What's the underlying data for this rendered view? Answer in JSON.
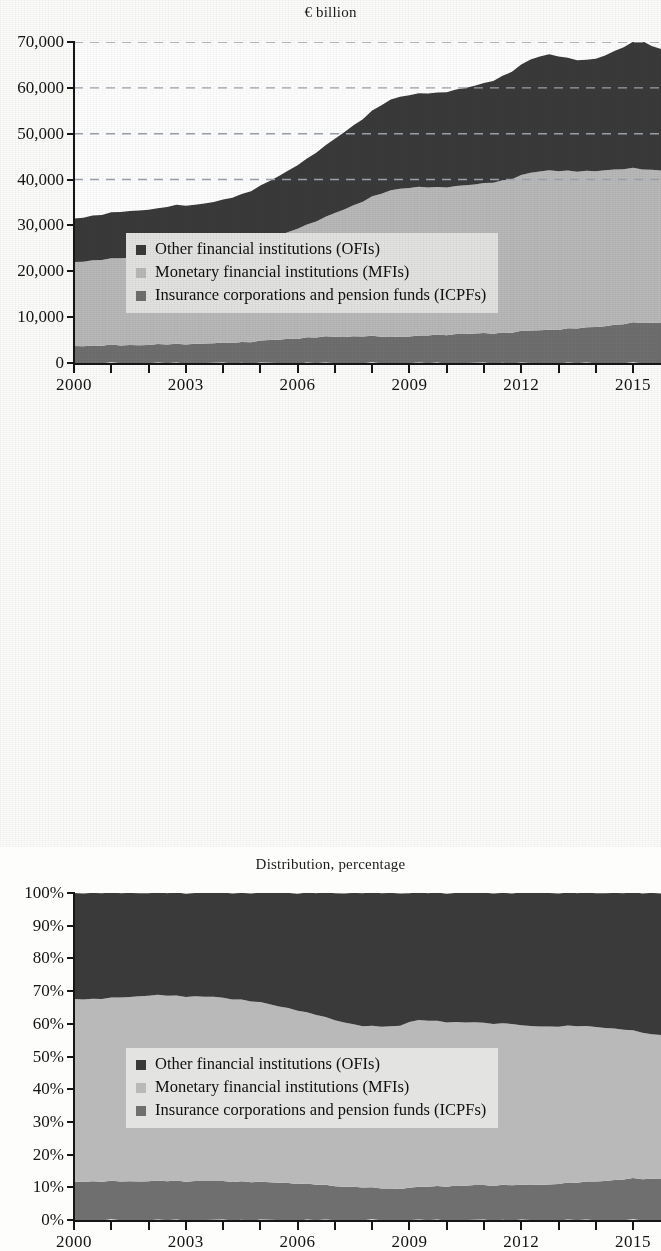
{
  "figure": {
    "panels": [
      {
        "id": "top",
        "title": "€ billion",
        "y_ticks": [
          "70,000",
          "60,000",
          "50,000",
          "40,000",
          "30,000",
          "20,000",
          "10,000",
          "0"
        ],
        "x_labels": [
          "2000",
          "2003",
          "2006",
          "2009",
          "2012",
          "2015"
        ]
      },
      {
        "id": "bottom",
        "title": "Distribution, percentage",
        "y_ticks": [
          "100%",
          "90%",
          "80%",
          "70%",
          "60%",
          "50%",
          "40%",
          "30%",
          "20%",
          "10%",
          "0%"
        ],
        "x_labels": [
          "2000",
          "2003",
          "2006",
          "2009",
          "2012",
          "2015"
        ]
      }
    ]
  },
  "legend": {
    "items": [
      {
        "label": "Other financial institutions (OFIs)",
        "swatch": "legend-swatch-ofi",
        "color": "#3a3a3a"
      },
      {
        "label": "Monetary financial institutions (MFIs)",
        "swatch": "legend-swatch-mfi",
        "color": "#b9b9b9"
      },
      {
        "label": "Insurance corporations and pension funds (ICPFs)",
        "swatch": "legend-swatch-icpf",
        "color": "#6f6f6f"
      }
    ]
  },
  "colors": {
    "ofi": "#3a3a3a",
    "mfi": "#b9b9b9",
    "icpf": "#6f6f6f",
    "axis": "#161616",
    "gridline": "#9aa3ad",
    "legend_background": "#e3e3e1",
    "plot_background": "#ffffff",
    "page_background": "#fdfdfb"
  },
  "chart_data": [
    {
      "type": "area",
      "id": "euro-billion-stacked-area",
      "title": "€ billion",
      "xlabel": "",
      "ylabel": "€ billion",
      "stacked": true,
      "grid": "horizontal-dashed (40,000 / 50,000 / 60,000 / 70,000)",
      "legend_position": "inside-lower-left",
      "xlim": [
        2000,
        2015.75
      ],
      "ylim": [
        0,
        70000
      ],
      "ytick_values": [
        0,
        10000,
        20000,
        30000,
        40000,
        50000,
        60000,
        70000
      ],
      "xtick_values": [
        2000,
        2001,
        2002,
        2003,
        2004,
        2005,
        2006,
        2007,
        2008,
        2009,
        2010,
        2011,
        2012,
        2013,
        2014,
        2015
      ],
      "xtick_labels_shown": [
        "2000",
        "2003",
        "2006",
        "2009",
        "2012",
        "2015"
      ],
      "x": [
        2000,
        2000.25,
        2000.5,
        2000.75,
        2001,
        2001.25,
        2001.5,
        2001.75,
        2002,
        2002.25,
        2002.5,
        2002.75,
        2003,
        2003.25,
        2003.5,
        2003.75,
        2004,
        2004.25,
        2004.5,
        2004.75,
        2005,
        2005.25,
        2005.5,
        2005.75,
        2006,
        2006.25,
        2006.5,
        2006.75,
        2007,
        2007.25,
        2007.5,
        2007.75,
        2008,
        2008.25,
        2008.5,
        2008.75,
        2009,
        2009.25,
        2009.5,
        2009.75,
        2010,
        2010.25,
        2010.5,
        2010.75,
        2011,
        2011.25,
        2011.5,
        2011.75,
        2012,
        2012.25,
        2012.5,
        2012.75,
        2013,
        2013.25,
        2013.5,
        2013.75,
        2014,
        2014.25,
        2014.5,
        2014.75,
        2015,
        2015.25,
        2015.5,
        2015.75
      ],
      "series": [
        {
          "name": "Insurance corporations and pension funds (ICPFs)",
          "short": "ICPFs",
          "color": "#6f6f6f",
          "values": [
            3700,
            3750,
            3800,
            3820,
            3850,
            3880,
            3900,
            3950,
            3980,
            4000,
            4050,
            4100,
            4150,
            4200,
            4250,
            4300,
            4350,
            4450,
            4550,
            4650,
            4800,
            4950,
            5100,
            5250,
            5400,
            5500,
            5600,
            5700,
            5750,
            5780,
            5800,
            5820,
            5800,
            5780,
            5750,
            5760,
            5800,
            5900,
            6000,
            6100,
            6200,
            6300,
            6350,
            6400,
            6450,
            6500,
            6600,
            6700,
            6900,
            7050,
            7150,
            7250,
            7350,
            7450,
            7550,
            7700,
            7900,
            8100,
            8300,
            8500,
            8700,
            8800,
            8750,
            8800
          ]
        },
        {
          "name": "Monetary financial institutions (MFIs)",
          "short": "MFIs",
          "color": "#b9b9b9",
          "values": [
            18300,
            18450,
            18600,
            18700,
            18850,
            19000,
            19050,
            19100,
            19150,
            19200,
            19300,
            19400,
            19500,
            19600,
            19750,
            19900,
            20100,
            20400,
            20750,
            21100,
            21600,
            22100,
            22700,
            23300,
            24000,
            24600,
            25300,
            26100,
            27000,
            27800,
            28600,
            29400,
            30400,
            31200,
            31900,
            32300,
            32400,
            32400,
            32300,
            32200,
            32200,
            32300,
            32400,
            32500,
            32700,
            32900,
            33200,
            33500,
            34000,
            34400,
            34600,
            34800,
            34600,
            34400,
            34200,
            34100,
            34000,
            34000,
            33900,
            33800,
            33700,
            33500,
            33350,
            33300
          ]
        },
        {
          "name": "Other financial institutions (OFIs)",
          "short": "OFIs",
          "color": "#3a3a3a",
          "values": [
            9500,
            9600,
            9750,
            9850,
            10000,
            10100,
            10200,
            10250,
            10350,
            10450,
            10700,
            10900,
            10800,
            10700,
            10800,
            10900,
            11100,
            11300,
            11500,
            11800,
            12200,
            12600,
            13000,
            13400,
            13900,
            14400,
            15000,
            15600,
            16200,
            16800,
            17400,
            18000,
            18700,
            19300,
            19800,
            20100,
            20200,
            20400,
            20500,
            20600,
            20800,
            21000,
            21200,
            21500,
            21800,
            22200,
            22800,
            23400,
            24100,
            24700,
            25100,
            25300,
            25000,
            24600,
            24300,
            24200,
            24500,
            25000,
            25800,
            26600,
            27500,
            28000,
            27000,
            26500
          ]
        }
      ]
    },
    {
      "type": "area",
      "id": "distribution-percentage-stacked-area",
      "title": "Distribution, percentage",
      "xlabel": "",
      "ylabel": "Distribution, percentage",
      "stacked": true,
      "normalized": true,
      "grid": "none",
      "legend_position": "inside-middle-left",
      "xlim": [
        2000,
        2015.75
      ],
      "ylim": [
        0,
        100
      ],
      "ytick_values": [
        0,
        10,
        20,
        30,
        40,
        50,
        60,
        70,
        80,
        90,
        100
      ],
      "xtick_values": [
        2000,
        2001,
        2002,
        2003,
        2004,
        2005,
        2006,
        2007,
        2008,
        2009,
        2010,
        2011,
        2012,
        2013,
        2014,
        2015
      ],
      "xtick_labels_shown": [
        "2000",
        "2003",
        "2006",
        "2009",
        "2012",
        "2015"
      ],
      "x": [
        2000,
        2000.25,
        2000.5,
        2000.75,
        2001,
        2001.25,
        2001.5,
        2001.75,
        2002,
        2002.25,
        2002.5,
        2002.75,
        2003,
        2003.25,
        2003.5,
        2003.75,
        2004,
        2004.25,
        2004.5,
        2004.75,
        2005,
        2005.25,
        2005.5,
        2005.75,
        2006,
        2006.25,
        2006.5,
        2006.75,
        2007,
        2007.25,
        2007.5,
        2007.75,
        2008,
        2008.25,
        2008.5,
        2008.75,
        2009,
        2009.25,
        2009.5,
        2009.75,
        2010,
        2010.25,
        2010.5,
        2010.75,
        2011,
        2011.25,
        2011.5,
        2011.75,
        2012,
        2012.25,
        2012.5,
        2012.75,
        2013,
        2013.25,
        2013.5,
        2013.75,
        2014,
        2014.25,
        2014.5,
        2014.75,
        2015,
        2015.25,
        2015.5,
        2015.75
      ],
      "series": [
        {
          "name": "Insurance corporations and pension funds (ICPFs)",
          "short": "ICPFs",
          "color": "#6f6f6f",
          "values": [
            11.8,
            11.8,
            11.8,
            11.8,
            11.8,
            11.8,
            11.8,
            11.9,
            11.9,
            11.9,
            11.9,
            11.9,
            11.9,
            11.9,
            11.9,
            11.9,
            11.8,
            11.8,
            11.8,
            11.7,
            11.6,
            11.5,
            11.4,
            11.3,
            11.2,
            11.0,
            10.8,
            10.6,
            10.4,
            10.3,
            10.1,
            10.0,
            9.8,
            9.7,
            9.6,
            9.6,
            9.9,
            10.0,
            10.2,
            10.3,
            10.4,
            10.5,
            10.5,
            10.6,
            10.6,
            10.6,
            10.7,
            10.8,
            10.6,
            10.7,
            10.8,
            10.9,
            11.2,
            11.3,
            11.4,
            11.6,
            11.9,
            12.0,
            12.2,
            12.4,
            12.6,
            12.6,
            12.6,
            12.8
          ]
        },
        {
          "name": "Monetary financial institutions (MFIs)",
          "short": "MFIs",
          "color": "#b9b9b9",
          "values": [
            55.8,
            55.8,
            55.8,
            55.9,
            56.0,
            56.3,
            56.4,
            56.6,
            56.8,
            56.8,
            56.7,
            56.6,
            56.5,
            56.5,
            56.4,
            56.3,
            56.0,
            55.8,
            55.6,
            55.3,
            54.9,
            54.4,
            53.9,
            53.5,
            53.0,
            52.4,
            51.9,
            51.3,
            50.7,
            50.2,
            49.7,
            49.3,
            49.4,
            49.5,
            49.6,
            49.9,
            50.7,
            51.0,
            50.8,
            50.5,
            50.2,
            50.0,
            49.9,
            49.8,
            49.6,
            49.5,
            49.4,
            49.3,
            48.8,
            48.6,
            48.4,
            48.3,
            48.1,
            48.0,
            47.9,
            47.6,
            47.2,
            46.8,
            46.3,
            45.8,
            45.2,
            44.8,
            44.2,
            43.9
          ]
        },
        {
          "name": "Other financial institutions (OFIs)",
          "short": "OFIs",
          "color": "#3a3a3a",
          "values": [
            32.4,
            32.4,
            32.4,
            32.3,
            32.2,
            31.9,
            31.8,
            31.5,
            31.3,
            31.3,
            31.4,
            31.5,
            31.6,
            31.6,
            31.7,
            31.8,
            32.2,
            32.4,
            32.6,
            33.0,
            33.5,
            34.1,
            34.7,
            35.2,
            35.8,
            36.6,
            37.3,
            38.1,
            38.9,
            39.5,
            40.2,
            40.7,
            40.8,
            40.8,
            40.8,
            40.5,
            39.4,
            39.0,
            39.0,
            39.2,
            39.4,
            39.5,
            39.6,
            39.6,
            39.8,
            39.9,
            39.9,
            39.9,
            40.6,
            40.7,
            40.8,
            40.8,
            40.7,
            40.7,
            40.7,
            40.8,
            40.9,
            41.2,
            41.5,
            41.8,
            42.2,
            42.6,
            43.2,
            43.3
          ]
        }
      ]
    }
  ]
}
